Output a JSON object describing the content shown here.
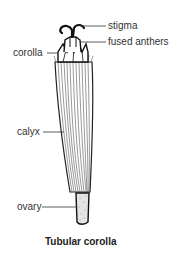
{
  "diagram": {
    "title": "Tubular corolla",
    "labels": {
      "stigma": "stigma",
      "fused_anthers": "fused anthers",
      "corolla": "corolla",
      "calyx": "calyx",
      "ovary": "ovary"
    },
    "colors": {
      "line": "#222222",
      "text": "#333333",
      "background": "#ffffff"
    }
  }
}
